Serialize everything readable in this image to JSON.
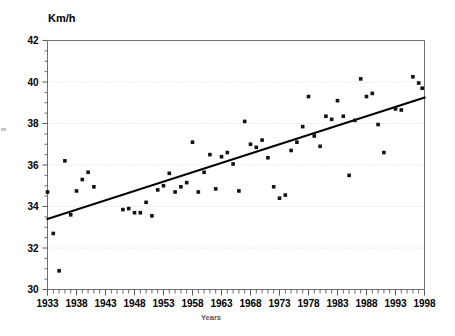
{
  "chart_data": {
    "type": "scatter",
    "title": "",
    "ylabel": "Km/h",
    "xlabel": "Years",
    "xlim": [
      1933,
      1998
    ],
    "ylim": [
      30,
      42
    ],
    "grid": true,
    "legend": null,
    "xticks": [
      1933,
      1938,
      1943,
      1948,
      1953,
      1958,
      1963,
      1968,
      1973,
      1978,
      1983,
      1988,
      1993,
      1998
    ],
    "xtick_labels": [
      "1933",
      "1938",
      "1943",
      "1948",
      "1953",
      "1958",
      "1963",
      "1968",
      "1973",
      "1978",
      "1983",
      "1988",
      "1993",
      "1998"
    ],
    "xtick_minor_step": 1,
    "yticks": [
      30,
      32,
      34,
      36,
      38,
      40,
      42
    ],
    "ytick_labels": [
      "30",
      "32",
      "34",
      "36",
      "38",
      "40",
      "42"
    ],
    "ytick_minor_step": 0.5,
    "series": [
      {
        "name": "Average speed",
        "marker": "square",
        "color": "#111111",
        "points": [
          [
            1933,
            34.7
          ],
          [
            1934,
            32.7
          ],
          [
            1935,
            30.9
          ],
          [
            1936,
            36.2
          ],
          [
            1937,
            33.6
          ],
          [
            1938,
            34.75
          ],
          [
            1939,
            35.3
          ],
          [
            1940,
            35.65
          ],
          [
            1941,
            34.95
          ],
          [
            1946,
            33.85
          ],
          [
            1947,
            33.9
          ],
          [
            1948,
            33.7
          ],
          [
            1949,
            33.7
          ],
          [
            1950,
            34.2
          ],
          [
            1951,
            33.55
          ],
          [
            1952,
            34.8
          ],
          [
            1953,
            35.0
          ],
          [
            1954,
            35.6
          ],
          [
            1955,
            34.7
          ],
          [
            1956,
            34.95
          ],
          [
            1957,
            35.15
          ],
          [
            1958,
            37.1
          ],
          [
            1959,
            34.7
          ],
          [
            1960,
            35.65
          ],
          [
            1961,
            36.5
          ],
          [
            1962,
            34.85
          ],
          [
            1963,
            36.4
          ],
          [
            1964,
            36.6
          ],
          [
            1965,
            36.05
          ],
          [
            1966,
            34.75
          ],
          [
            1967,
            38.1
          ],
          [
            1968,
            37.0
          ],
          [
            1969,
            36.85
          ],
          [
            1970,
            37.2
          ],
          [
            1971,
            36.35
          ],
          [
            1972,
            34.95
          ],
          [
            1973,
            34.4
          ],
          [
            1974,
            34.55
          ],
          [
            1975,
            36.7
          ],
          [
            1976,
            37.1
          ],
          [
            1977,
            37.85
          ],
          [
            1978,
            39.3
          ],
          [
            1979,
            37.4
          ],
          [
            1980,
            36.9
          ],
          [
            1981,
            38.35
          ],
          [
            1982,
            38.2
          ],
          [
            1983,
            39.1
          ],
          [
            1984,
            38.35
          ],
          [
            1985,
            35.5
          ],
          [
            1986,
            38.15
          ],
          [
            1987,
            40.15
          ],
          [
            1988,
            39.3
          ],
          [
            1989,
            39.45
          ],
          [
            1990,
            37.95
          ],
          [
            1991,
            36.6
          ],
          [
            1993,
            38.7
          ],
          [
            1994,
            38.65
          ],
          [
            1996,
            40.25
          ],
          [
            1997,
            39.95
          ],
          [
            1997.6,
            39.7
          ]
        ]
      }
    ],
    "trendline": {
      "name": "Linear trend",
      "x_start": 1933,
      "y_start": 33.4,
      "x_end": 1998,
      "y_end": 39.25,
      "color": "#000000"
    }
  }
}
